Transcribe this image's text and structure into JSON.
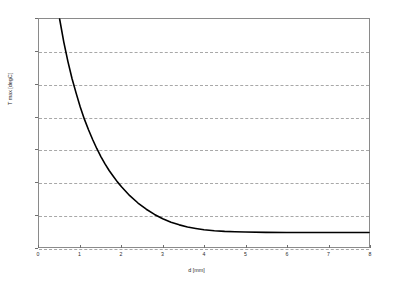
{
  "chart_data": {
    "type": "line",
    "title": "",
    "xlabel": "d [mm]",
    "ylabel": "T max [degC]",
    "xlim": [
      0,
      8
    ],
    "ylim": [
      122,
      136
    ],
    "xticks": [
      0,
      1,
      2,
      3,
      4,
      5,
      6,
      7,
      8
    ],
    "yticks": [
      122,
      124,
      126,
      128,
      130,
      132,
      134,
      136
    ],
    "grid": "horizontal-dashed",
    "legend": "none",
    "series": [
      {
        "name": "T max",
        "color": "#000000",
        "x": [
          0.5,
          0.6,
          0.7,
          0.8,
          0.9,
          1.0,
          1.1,
          1.2,
          1.3,
          1.4,
          1.5,
          1.6,
          1.7,
          1.8,
          1.9,
          2.0,
          2.2,
          2.4,
          2.6,
          2.8,
          3.0,
          3.2,
          3.4,
          3.6,
          3.8,
          4.0,
          4.25,
          4.5,
          4.75,
          5.0,
          5.5,
          6.0,
          6.5,
          7.0,
          7.5,
          8.0
        ],
        "y": [
          136.0,
          134.6,
          133.4,
          132.35,
          131.45,
          130.6,
          129.85,
          129.2,
          128.6,
          128.05,
          127.55,
          127.1,
          126.7,
          126.35,
          126.0,
          125.7,
          125.15,
          124.7,
          124.32,
          124.0,
          123.73,
          123.52,
          123.36,
          123.23,
          123.14,
          123.06,
          123.0,
          122.96,
          122.94,
          122.92,
          122.9,
          122.89,
          122.89,
          122.89,
          122.89,
          122.89
        ]
      }
    ]
  },
  "axes": {
    "y_tick_labels": [
      "136",
      "134",
      "132",
      "130",
      "128",
      "126",
      "124",
      "122"
    ],
    "x_tick_labels": [
      "0",
      "1",
      "2",
      "3",
      "4",
      "5",
      "6",
      "7",
      "8"
    ]
  },
  "colors": {
    "curve": "#000000",
    "grid": "#a8a8a8",
    "frame": "#8a8a8a",
    "text": "#2b2b2b",
    "background": "#ffffff"
  }
}
